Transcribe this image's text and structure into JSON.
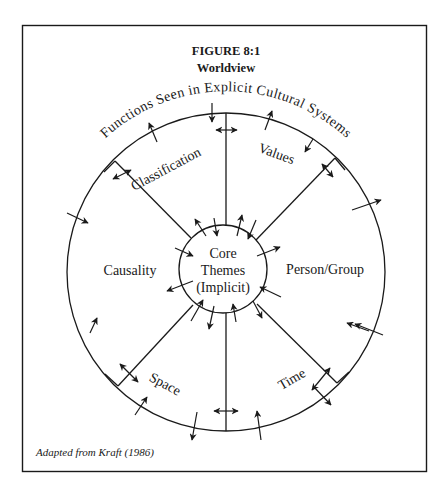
{
  "figure": {
    "number": "FIGURE 8:1",
    "title": "Worldview",
    "arc_heading": "Functions Seen in Explicit Cultural Systems",
    "core": {
      "line1": "Core",
      "line2": "Themes",
      "line3": "(Implicit)"
    },
    "segments": [
      {
        "id": "classification",
        "label": "Classification"
      },
      {
        "id": "values",
        "label": "Values"
      },
      {
        "id": "person-group",
        "label": "Person/Group"
      },
      {
        "id": "time",
        "label": "Time"
      },
      {
        "id": "space",
        "label": "Space"
      },
      {
        "id": "causality",
        "label": "Causality"
      }
    ],
    "caption": "Adapted from Kraft (1986)"
  },
  "colors": {
    "ink": "#1a1a1a",
    "paper": "#ffffff"
  }
}
